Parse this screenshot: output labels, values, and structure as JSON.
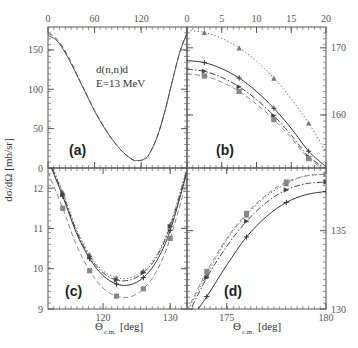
{
  "chart_data": [
    {
      "panel": "a",
      "type": "line",
      "label": "(a)",
      "annotation": [
        "d(n,n)d",
        "E=13 MeV"
      ],
      "xlim": [
        0,
        179
      ],
      "ylim": [
        0,
        179
      ],
      "xticks": [
        0,
        60,
        120
      ],
      "xtick_labels": [
        "0",
        "60",
        "120"
      ],
      "x_axis_position": "top",
      "yticks": [
        0,
        50,
        100,
        150
      ],
      "ytick_labels": [
        "0",
        "50",
        "100",
        "150"
      ],
      "y_axis_position": "left",
      "series": [
        {
          "name": "full",
          "style": "solid",
          "x": [
            0,
            10,
            20,
            30,
            40,
            50,
            60,
            70,
            80,
            90,
            100,
            110,
            115,
            120,
            125,
            130,
            140,
            150,
            160,
            170,
            179
          ],
          "y": [
            168,
            163,
            150,
            132,
            112,
            92,
            72,
            55,
            40,
            27,
            17,
            10,
            9.5,
            9.8,
            12,
            17,
            38,
            70,
            110,
            148,
            170
          ]
        },
        {
          "name": "variant",
          "style": "dashed",
          "x": [
            0,
            10,
            20,
            30,
            40,
            50,
            60,
            70,
            80,
            90,
            100,
            110,
            115,
            120,
            125,
            130,
            140,
            150,
            160,
            170,
            179
          ],
          "y": [
            171,
            165,
            152,
            134,
            113,
            93,
            73,
            56,
            40,
            27,
            17,
            10,
            9.4,
            9.6,
            12,
            17,
            38,
            70,
            110,
            148,
            172
          ]
        }
      ]
    },
    {
      "panel": "b",
      "type": "line",
      "label": "(b)",
      "xlim": [
        0,
        20
      ],
      "ylim": [
        152.1,
        173.1
      ],
      "xticks": [
        0,
        5,
        10,
        15,
        20
      ],
      "xtick_labels": [
        "0",
        "5",
        "10",
        "15",
        "20"
      ],
      "x_axis_position": "top",
      "yticks": [
        160,
        170
      ],
      "ytick_labels": [
        "160",
        "170"
      ],
      "y_axis_position": "right",
      "series": [
        {
          "name": "curve-1",
          "style": "dotted",
          "color": "#777777",
          "marker": "triangle",
          "x": [
            0,
            2.5,
            5,
            7.5,
            10,
            12.5,
            15,
            17.5,
            20
          ],
          "y": [
            172.6,
            172.3,
            171.4,
            170.0,
            168.0,
            165.5,
            162.4,
            158.8,
            154.5
          ]
        },
        {
          "name": "curve-2",
          "style": "solid",
          "color": "#333333",
          "marker": "plus",
          "x": [
            0,
            2.5,
            5,
            7.5,
            10,
            12.5,
            15,
            17.5,
            20
          ],
          "y": [
            168.1,
            167.8,
            166.9,
            165.5,
            163.5,
            161.0,
            158.0,
            154.6,
            152.3
          ]
        },
        {
          "name": "curve-3",
          "style": "dashdot",
          "color": "#444444",
          "marker": "right-triangle",
          "x": [
            0,
            2.5,
            5,
            7.5,
            10,
            12.5,
            15,
            17.5,
            20
          ],
          "y": [
            166.8,
            166.5,
            165.6,
            164.2,
            162.3,
            159.9,
            157.0,
            153.8,
            152.0
          ]
        },
        {
          "name": "curve-4",
          "style": "dashed",
          "color": "#888888",
          "marker": "square",
          "x": [
            0,
            2.5,
            5,
            7.5,
            10,
            12.5,
            15,
            17.5,
            20
          ],
          "y": [
            166.1,
            165.8,
            164.9,
            163.5,
            161.6,
            159.3,
            156.6,
            153.5,
            151.8
          ]
        }
      ]
    },
    {
      "panel": "c",
      "type": "line",
      "label": "(c)",
      "xlim": [
        111.8,
        132.5
      ],
      "ylim": [
        9,
        12.5
      ],
      "xticks": [
        120,
        130
      ],
      "xtick_labels": [
        "120",
        "130"
      ],
      "x_axis_position": "bottom",
      "xlabel": "Θc.m. [deg]",
      "yticks": [
        9,
        10,
        11,
        12
      ],
      "ytick_labels": [
        "9",
        "10",
        "11",
        "12"
      ],
      "y_axis_position": "left",
      "series": [
        {
          "name": "curve-1",
          "style": "dotted",
          "color": "#777777",
          "marker": "triangle",
          "x": [
            111.8,
            114,
            116,
            118,
            120,
            122,
            124,
            126,
            128,
            130,
            132.5
          ],
          "y": [
            12.8,
            11.9,
            11.0,
            10.35,
            9.95,
            9.78,
            9.77,
            9.95,
            10.35,
            11.1,
            12.5
          ]
        },
        {
          "name": "curve-2",
          "style": "solid",
          "color": "#333333",
          "marker": "plus",
          "x": [
            111.8,
            114,
            116,
            118,
            120,
            122,
            124,
            126,
            128,
            130,
            132.5
          ],
          "y": [
            12.7,
            11.8,
            10.9,
            10.25,
            9.83,
            9.62,
            9.6,
            9.78,
            10.2,
            10.95,
            12.4
          ]
        },
        {
          "name": "curve-3",
          "style": "dashdot",
          "color": "#444444",
          "marker": "right-triangle",
          "x": [
            111.8,
            114,
            116,
            118,
            120,
            122,
            124,
            126,
            128,
            130,
            132.5
          ],
          "y": [
            12.75,
            11.85,
            10.95,
            10.3,
            9.9,
            9.72,
            9.72,
            9.9,
            10.3,
            11.05,
            12.45
          ]
        },
        {
          "name": "curve-4",
          "style": "dashed",
          "color": "#888888",
          "marker": "square",
          "x": [
            111.8,
            114,
            116,
            118,
            120,
            122,
            124,
            126,
            128,
            130,
            132.5
          ],
          "y": [
            12.4,
            11.5,
            10.6,
            9.95,
            9.52,
            9.32,
            9.3,
            9.5,
            9.95,
            10.75,
            12.2
          ]
        }
      ]
    },
    {
      "panel": "d",
      "type": "line",
      "label": "(d)",
      "xlim": [
        173,
        180
      ],
      "ylim": [
        130,
        139
      ],
      "xticks": [
        175,
        180
      ],
      "xtick_labels": [
        "175",
        "180"
      ],
      "x_axis_position": "bottom",
      "xlabel": "Θc.m. [deg]",
      "yticks": [
        130,
        135
      ],
      "ytick_labels": [
        "130",
        "135"
      ],
      "y_axis_position": "right",
      "series": [
        {
          "name": "curve-1",
          "style": "dotted",
          "color": "#777777",
          "marker": "triangle",
          "x": [
            173,
            174,
            175,
            176,
            177,
            178,
            179,
            180
          ],
          "y": [
            129.8,
            132.2,
            134.4,
            136.0,
            137.2,
            138.0,
            138.5,
            138.6
          ]
        },
        {
          "name": "curve-2",
          "style": "dashdot",
          "color": "#444444",
          "marker": "right-triangle",
          "x": [
            173,
            174,
            175,
            176,
            177,
            178,
            179,
            180
          ],
          "y": [
            129.5,
            132.0,
            134.0,
            135.6,
            136.8,
            137.6,
            138.0,
            138.1
          ]
        },
        {
          "name": "curve-3",
          "style": "dashed",
          "color": "#888888",
          "marker": "square",
          "x": [
            173,
            174,
            175,
            176,
            177,
            178,
            179,
            180
          ],
          "y": [
            129.9,
            132.4,
            134.5,
            136.1,
            137.3,
            138.1,
            138.5,
            138.6
          ]
        },
        {
          "name": "curve-4",
          "style": "solid",
          "color": "#333333",
          "marker": "plus",
          "x": [
            173,
            174,
            175,
            176,
            177,
            178,
            179,
            180
          ],
          "y": [
            129.0,
            130.8,
            132.8,
            134.6,
            135.9,
            136.8,
            137.3,
            137.5
          ]
        }
      ]
    }
  ],
  "figure": {
    "ylabel": "dσ/dΩ [mb/sr]",
    "xlabel_main": "Θ",
    "xlabel_sub": "c.m.",
    "xlabel_unit": "[deg]"
  }
}
